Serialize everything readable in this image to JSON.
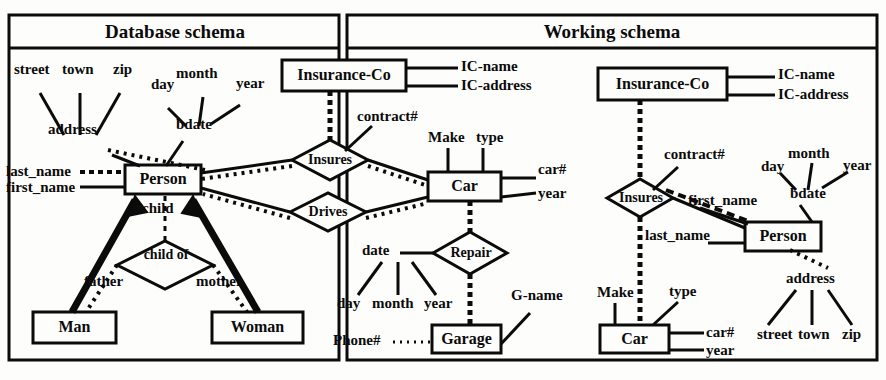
{
  "figure": {
    "panels": [
      {
        "id": "database-schema",
        "title": "Database schema",
        "entities": [
          {
            "name": "Insurance-Co"
          },
          {
            "name": "Person"
          },
          {
            "name": "Car"
          },
          {
            "name": "Man"
          },
          {
            "name": "Woman"
          },
          {
            "name": "Garage"
          }
        ],
        "relationships": [
          {
            "name": "Insures"
          },
          {
            "name": "Drives"
          },
          {
            "name": "child of"
          },
          {
            "name": "Repair"
          }
        ],
        "attributes": [
          {
            "name": "street"
          },
          {
            "name": "town"
          },
          {
            "name": "zip"
          },
          {
            "name": "address"
          },
          {
            "name": "day"
          },
          {
            "name": "month"
          },
          {
            "name": "year"
          },
          {
            "name": "bdate"
          },
          {
            "name": "last_name"
          },
          {
            "name": "first_name"
          },
          {
            "name": "IC-name"
          },
          {
            "name": "IC-address"
          },
          {
            "name": "contract#"
          },
          {
            "name": "Make"
          },
          {
            "name": "type"
          },
          {
            "name": "car#"
          },
          {
            "name": "year"
          },
          {
            "name": "date"
          },
          {
            "name": "day"
          },
          {
            "name": "month"
          },
          {
            "name": "year"
          },
          {
            "name": "G-name"
          },
          {
            "name": "Phone#"
          }
        ],
        "roles": [
          {
            "name": "child"
          },
          {
            "name": "father"
          },
          {
            "name": "mother"
          }
        ]
      },
      {
        "id": "working-schema",
        "title": "Working schema",
        "entities": [
          {
            "name": "Insurance-Co"
          },
          {
            "name": "Person"
          },
          {
            "name": "Car"
          }
        ],
        "relationships": [
          {
            "name": "Insures"
          }
        ],
        "attributes": [
          {
            "name": "IC-name"
          },
          {
            "name": "IC-address"
          },
          {
            "name": "contract#"
          },
          {
            "name": "day"
          },
          {
            "name": "month"
          },
          {
            "name": "year"
          },
          {
            "name": "bdate"
          },
          {
            "name": "first_name"
          },
          {
            "name": "last_name"
          },
          {
            "name": "address"
          },
          {
            "name": "street"
          },
          {
            "name": "town"
          },
          {
            "name": "zip"
          },
          {
            "name": "Make"
          },
          {
            "name": "type"
          },
          {
            "name": "car#"
          },
          {
            "name": "year"
          }
        ]
      }
    ]
  },
  "left": {
    "title": "Database schema",
    "street": "street",
    "town": "town",
    "zip": "zip",
    "address": "address",
    "day": "day",
    "month": "month",
    "year": "year",
    "bdate": "bdate",
    "last_name": "last_name",
    "first_name": "first_name",
    "person": "Person",
    "child": "child",
    "child_of": "child of",
    "father": "father",
    "mother": "mother",
    "man": "Man",
    "woman": "Woman",
    "insurance_co": "Insurance-Co",
    "ic_name": "IC-name",
    "ic_address": "IC-address",
    "contract": "contract#",
    "insures": "Insures",
    "drives": "Drives",
    "make": "Make",
    "type": "type",
    "car": "Car",
    "car_num": "car#",
    "car_year": "year",
    "repair": "Repair",
    "date": "date",
    "r_day": "day",
    "r_month": "month",
    "r_year": "year",
    "g_name": "G-name",
    "phone": "Phone#",
    "garage": "Garage"
  },
  "right": {
    "title": "Working schema",
    "insurance_co": "Insurance-Co",
    "ic_name": "IC-name",
    "ic_address": "IC-address",
    "contract": "contract#",
    "insures": "Insures",
    "day": "day",
    "month": "month",
    "year": "year",
    "bdate": "bdate",
    "first_name": "first_name",
    "last_name": "last_name",
    "person": "Person",
    "address": "address",
    "street": "street",
    "town": "town",
    "zip": "zip",
    "make": "Make",
    "type": "type",
    "car": "Car",
    "car_num": "car#",
    "car_year": "year"
  },
  "colors": {
    "ink": "#0b0b0b",
    "paper": "#fdfdfb"
  }
}
